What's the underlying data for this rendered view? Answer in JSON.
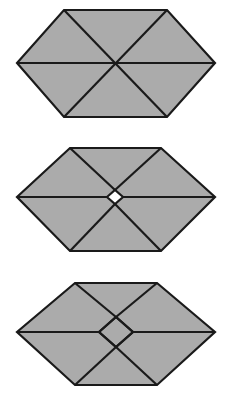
{
  "canvas": {
    "width": 230,
    "height": 402,
    "background_color": "#ffffff"
  },
  "style": {
    "fill_color": "#ababab",
    "stroke_color": "#1a1a1a",
    "stroke_width": 2.2,
    "hole_color": "#ffffff"
  },
  "figures": [
    {
      "id": "figure-1",
      "name": "hexagon-six-triangles",
      "description": "Gray hexagon dissected into six triangles by three full diagonals meeting at one central point.",
      "panel_top": 0,
      "outline": [
        [
          64,
          10
        ],
        [
          167,
          10
        ],
        [
          215,
          63
        ],
        [
          167,
          117
        ],
        [
          64,
          117
        ],
        [
          17,
          63
        ]
      ],
      "center": [
        115,
        63
      ],
      "center_hole": null,
      "cuts": [
        [
          [
            17,
            63
          ],
          [
            215,
            63
          ]
        ],
        [
          [
            64,
            10
          ],
          [
            167,
            117
          ]
        ],
        [
          [
            167,
            10
          ],
          [
            64,
            117
          ]
        ]
      ]
    },
    {
      "id": "figure-2",
      "name": "hexagon-small-central-rhombus",
      "description": "Gray hexagon with offset diagonals forming a small white rhombus hole at the center; the horizontal cut terminates at the rhombus side vertices.",
      "panel_top": 134,
      "outline": [
        [
          70,
          14
        ],
        [
          161,
          14
        ],
        [
          215,
          63
        ],
        [
          161,
          117
        ],
        [
          70,
          117
        ],
        [
          17,
          63
        ]
      ],
      "center": [
        115,
        63
      ],
      "center_hole": {
        "shape": "rhombus",
        "points": [
          [
            107,
            63
          ],
          [
            115,
            56
          ],
          [
            123,
            63
          ],
          [
            115,
            70
          ]
        ],
        "width": 16,
        "height": 14
      },
      "cuts": [
        [
          [
            17,
            63
          ],
          [
            107,
            63
          ]
        ],
        [
          [
            123,
            63
          ],
          [
            215,
            63
          ]
        ],
        [
          [
            70,
            14
          ],
          [
            115,
            56
          ]
        ],
        [
          [
            115,
            70
          ],
          [
            161,
            117
          ]
        ],
        [
          [
            161,
            14
          ],
          [
            115,
            56
          ]
        ],
        [
          [
            115,
            70
          ],
          [
            70,
            117
          ]
        ]
      ]
    },
    {
      "id": "figure-3",
      "name": "hexagon-large-central-rhombus",
      "description": "Gray hexagon with widely offset diagonals forming a large filled rhombus at the center; the horizontal cut terminates at the rhombus side vertices.",
      "panel_top": 268,
      "outline": [
        [
          75,
          15
        ],
        [
          157,
          15
        ],
        [
          215,
          64
        ],
        [
          157,
          117
        ],
        [
          75,
          117
        ],
        [
          17,
          64
        ]
      ],
      "center": [
        116,
        64
      ],
      "center_hole": {
        "shape": "rhombus",
        "points": [
          [
            99,
            64
          ],
          [
            116,
            49
          ],
          [
            133,
            64
          ],
          [
            116,
            79
          ]
        ],
        "width": 34,
        "height": 30,
        "filled": true
      },
      "cuts": [
        [
          [
            17,
            64
          ],
          [
            99,
            64
          ]
        ],
        [
          [
            133,
            64
          ],
          [
            215,
            64
          ]
        ],
        [
          [
            75,
            15
          ],
          [
            116,
            49
          ]
        ],
        [
          [
            116,
            79
          ],
          [
            157,
            117
          ]
        ],
        [
          [
            157,
            15
          ],
          [
            116,
            49
          ]
        ],
        [
          [
            116,
            79
          ],
          [
            75,
            117
          ]
        ],
        [
          [
            99,
            64
          ],
          [
            116,
            49
          ]
        ],
        [
          [
            116,
            49
          ],
          [
            133,
            64
          ]
        ],
        [
          [
            133,
            64
          ],
          [
            116,
            79
          ]
        ],
        [
          [
            116,
            79
          ],
          [
            99,
            64
          ]
        ]
      ]
    }
  ]
}
